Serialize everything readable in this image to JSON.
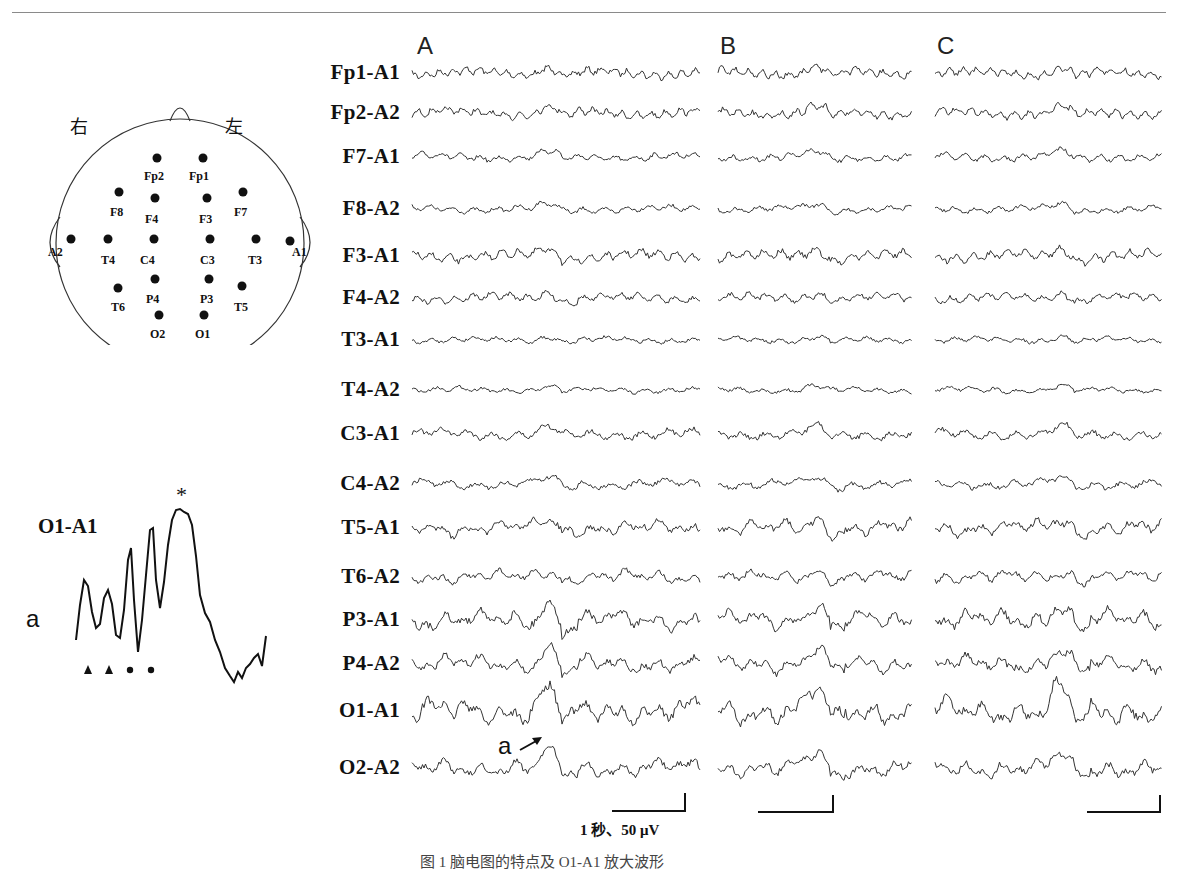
{
  "figure": {
    "panels": [
      "A",
      "B",
      "C"
    ],
    "channels": [
      "Fp1-A1",
      "Fp2-A2",
      "F7-A1",
      "F8-A2",
      "F3-A1",
      "F4-A2",
      "T3-A1",
      "T4-A2",
      "C3-A1",
      "C4-A2",
      "T5-A1",
      "T6-A2",
      "P3-A1",
      "P4-A2",
      "O1-A1",
      "O2-A2"
    ],
    "channel_y": [
      73,
      113,
      157,
      209,
      256,
      298,
      340,
      390,
      434,
      484,
      528,
      577,
      620,
      664,
      711,
      768
    ],
    "trace_amp": [
      1.0,
      1.0,
      0.8,
      0.7,
      1.1,
      0.9,
      0.6,
      0.6,
      1.0,
      0.9,
      1.2,
      1.0,
      1.5,
      1.3,
      1.8,
      1.3
    ],
    "trace_freq": [
      2.6,
      2.4,
      1.8,
      1.6,
      2.0,
      1.9,
      1.6,
      1.5,
      1.4,
      1.3,
      1.1,
      1.1,
      1.0,
      1.0,
      0.95,
      1.0
    ],
    "panel_x": [
      [
        412,
        700
      ],
      [
        718,
        912
      ],
      [
        935,
        1162
      ]
    ],
    "event_pos": [
      0.47,
      0.5,
      0.55
    ],
    "scale_bar": {
      "label": "1 秒、50 μV"
    },
    "trace_annotation": "a"
  },
  "head_map": {
    "right_label": "右",
    "left_label": "左",
    "electrodes": [
      {
        "name": "Fp2",
        "x": 135,
        "y": 63,
        "lx": 122,
        "ly": 74
      },
      {
        "name": "Fp1",
        "x": 181,
        "y": 63,
        "lx": 167,
        "ly": 74
      },
      {
        "name": "F8",
        "x": 97,
        "y": 97,
        "lx": 88,
        "ly": 110
      },
      {
        "name": "F4",
        "x": 133,
        "y": 103,
        "lx": 123,
        "ly": 117
      },
      {
        "name": "F3",
        "x": 185,
        "y": 103,
        "lx": 177,
        "ly": 117
      },
      {
        "name": "F7",
        "x": 221,
        "y": 97,
        "lx": 212,
        "ly": 110
      },
      {
        "name": "A2",
        "x": 49,
        "y": 144,
        "lx": 26,
        "ly": 150
      },
      {
        "name": "T4",
        "x": 86,
        "y": 144,
        "lx": 79,
        "ly": 158
      },
      {
        "name": "C4",
        "x": 132,
        "y": 144,
        "lx": 118,
        "ly": 158
      },
      {
        "name": "C3",
        "x": 188,
        "y": 144,
        "lx": 178,
        "ly": 158
      },
      {
        "name": "T3",
        "x": 234,
        "y": 144,
        "lx": 226,
        "ly": 158
      },
      {
        "name": "A1",
        "x": 268,
        "y": 146,
        "lx": 270,
        "ly": 150
      },
      {
        "name": "P4",
        "x": 133,
        "y": 184,
        "lx": 124,
        "ly": 197
      },
      {
        "name": "P3",
        "x": 187,
        "y": 184,
        "lx": 178,
        "ly": 197
      },
      {
        "name": "T6",
        "x": 96,
        "y": 193,
        "lx": 89,
        "ly": 205
      },
      {
        "name": "T5",
        "x": 220,
        "y": 191,
        "lx": 212,
        "ly": 205
      },
      {
        "name": "O2",
        "x": 137,
        "y": 220,
        "lx": 128,
        "ly": 232
      },
      {
        "name": "O1",
        "x": 182,
        "y": 220,
        "lx": 173,
        "ly": 232
      }
    ]
  },
  "inset": {
    "channel": "O1-A1",
    "label": "a",
    "peak_marker": "*",
    "markers": [
      "triangle",
      "triangle",
      "dot",
      "dot"
    ]
  },
  "caption": "图 1  脑电图的特点及 O1-A1 放大波形"
}
